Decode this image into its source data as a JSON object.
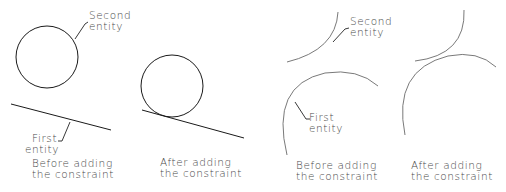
{
  "panels": [
    {
      "id": "line-circle-before",
      "caption": [
        "Before adding",
        "the constraint"
      ],
      "labels": {
        "second": [
          "Second",
          "entity"
        ],
        "first": [
          "First",
          "entity"
        ]
      }
    },
    {
      "id": "line-circle-after",
      "caption": [
        "After adding",
        "the constraint"
      ]
    },
    {
      "id": "arc-arc-before",
      "caption": [
        "Before adding",
        "the constraint"
      ],
      "labels": {
        "second": [
          "Second",
          "entity"
        ],
        "first": [
          "First",
          "entity"
        ]
      }
    },
    {
      "id": "arc-arc-after",
      "caption": [
        "After adding",
        "the constraint"
      ]
    }
  ],
  "colors": {
    "stroke": "#1a1a1a",
    "text": "#4a4a4a"
  }
}
